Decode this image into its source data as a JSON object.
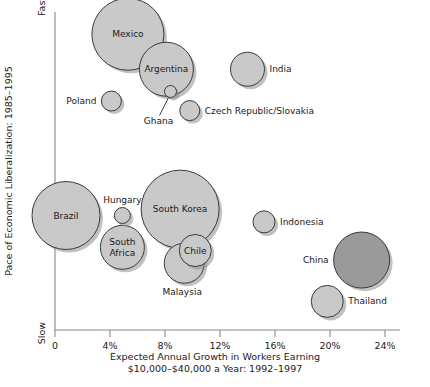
{
  "chart_data": {
    "type": "scatter",
    "title": "",
    "xlabel": "Expected Annual Growth in Workers Earning $10,000–$40,000 a Year: 1992–1997",
    "xlabel_line1": "Expected Annual Growth in Workers Earning",
    "xlabel_line2": "$10,000–$40,000 a Year: 1992–1997",
    "ylabel": "Pace of Economic Liberalization: 1985–1995",
    "y_axis_top_label": "Fast",
    "y_axis_bottom_label": "Slow",
    "xlim": [
      0,
      24
    ],
    "x_ticks": [
      "0",
      "4%",
      "8%",
      "12%",
      "16%",
      "20%",
      "24%"
    ],
    "x_tick_values": [
      0,
      4,
      8,
      12,
      16,
      20,
      24
    ],
    "y_axis_type": "qualitative",
    "grid": false,
    "legend": "none",
    "bubble_default_color": "#c9c9c9",
    "bubble_highlight_color": "#9a9a9a",
    "points": [
      {
        "name": "Mexico",
        "x": 5.3,
        "y_pace": 0.93,
        "size": 36,
        "label_pos": "inside",
        "color": "#c9c9c9"
      },
      {
        "name": "Argentina",
        "x": 8.1,
        "y_pace": 0.82,
        "size": 27,
        "label_pos": "inside",
        "color": "#c9c9c9"
      },
      {
        "name": "Poland",
        "x": 4.1,
        "y_pace": 0.72,
        "size": 10,
        "label_pos": "left",
        "color": "#c9c9c9"
      },
      {
        "name": "Ghana",
        "x": 8.4,
        "y_pace": 0.75,
        "size": 6,
        "label_pos": "leader-below",
        "color": "#c9c9c9"
      },
      {
        "name": "Czech Republic/Slovakia",
        "x": 9.8,
        "y_pace": 0.69,
        "size": 10,
        "label_pos": "right",
        "color": "#c9c9c9"
      },
      {
        "name": "India",
        "x": 14.0,
        "y_pace": 0.82,
        "size": 17,
        "label_pos": "right",
        "color": "#c9c9c9"
      },
      {
        "name": "Brazil",
        "x": 0.8,
        "y_pace": 0.36,
        "size": 34,
        "label_pos": "inside",
        "color": "#c9c9c9"
      },
      {
        "name": "Hungary",
        "x": 4.9,
        "y_pace": 0.36,
        "size": 8,
        "label_pos": "above",
        "color": "#c9c9c9"
      },
      {
        "name": "South Africa",
        "x": 4.9,
        "y_pace": 0.26,
        "size": 22,
        "label_pos": "inside",
        "color": "#c9c9c9"
      },
      {
        "name": "South Korea",
        "x": 9.1,
        "y_pace": 0.38,
        "size": 39,
        "label_pos": "inside",
        "color": "#c9c9c9"
      },
      {
        "name": "Malaysia",
        "x": 9.4,
        "y_pace": 0.21,
        "size": 20,
        "label_pos": "below",
        "color": "#c9c9c9"
      },
      {
        "name": "Chile",
        "x": 10.2,
        "y_pace": 0.25,
        "size": 16,
        "label_pos": "inside",
        "color": "#c9c9c9"
      },
      {
        "name": "Indonesia",
        "x": 15.2,
        "y_pace": 0.34,
        "size": 11,
        "label_pos": "right",
        "color": "#c9c9c9"
      },
      {
        "name": "China",
        "x": 22.3,
        "y_pace": 0.22,
        "size": 28,
        "label_pos": "left",
        "color": "#9a9a9a"
      },
      {
        "name": "Thailand",
        "x": 19.8,
        "y_pace": 0.09,
        "size": 16,
        "label_pos": "right",
        "color": "#c9c9c9"
      }
    ]
  }
}
